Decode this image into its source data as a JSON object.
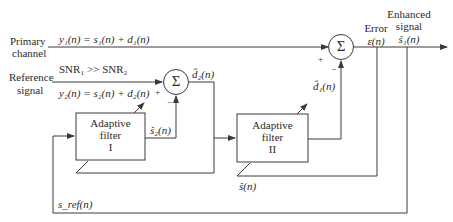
{
  "diagram": {
    "type": "block-diagram",
    "inputs": {
      "primary": {
        "label_line1": "Primary",
        "label_line2": "channel",
        "equation": "y₁(n) = s₁(n) + d₁(n)"
      },
      "reference": {
        "label_line1": "Reference",
        "label_line2": "signal",
        "equation": "y₂(n) = s₂(n) + d₂(n)",
        "snr_note": "SNR₁ >> SNR₂"
      }
    },
    "blocks": [
      {
        "id": "filter1",
        "line1": "Adaptive",
        "line2": "filter",
        "line3": "I"
      },
      {
        "id": "filter2",
        "line1": "Adaptive",
        "line2": "filter",
        "line3": "II"
      }
    ],
    "summers": [
      {
        "id": "sum1",
        "symbol": "Σ",
        "plus": "+",
        "minus": "−"
      },
      {
        "id": "sum2",
        "symbol": "Σ",
        "plus": "+",
        "minus": "−"
      }
    ],
    "signals": {
      "d2_hat": "d̂₂(n)",
      "s2_hat": "ŝ₂(n)",
      "d1_hat": "d̂₁(n)",
      "s_hat": "ŝ(n)",
      "s_ref": "s_ref(n)",
      "error_label": "Error",
      "error_symbol": "ε(n)",
      "output_line1": "Enhanced",
      "output_line2": "signal",
      "output_symbol": "ŝ₁(n)"
    },
    "colors": {
      "line": "#3a3a3a",
      "text": "#2a2a2a",
      "background": "#ffffff"
    }
  }
}
